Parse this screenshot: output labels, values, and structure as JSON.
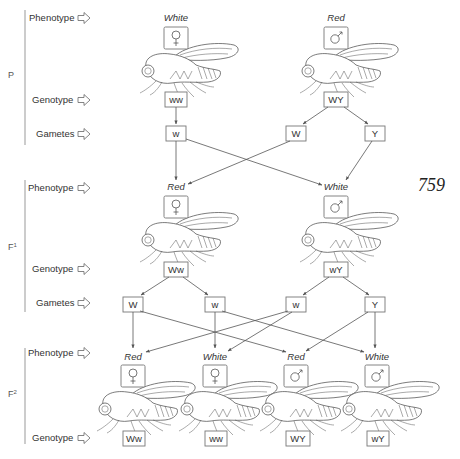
{
  "page_number": "759",
  "row_labels": {
    "phenotype": "Phenotype",
    "genotype": "Genotype",
    "gametes": "Gametes"
  },
  "generations": [
    {
      "label": "P",
      "phenotypes": [
        {
          "text": "White",
          "sex": "female",
          "sex_icon": "female-symbol-icon"
        },
        {
          "text": "Red",
          "sex": "male",
          "sex_icon": "male-symbol-icon"
        }
      ],
      "genotypes": [
        "ww",
        "WY"
      ],
      "gametes": [
        "w",
        "W",
        "Y"
      ]
    },
    {
      "label": "F1",
      "phenotypes": [
        {
          "text": "Red",
          "sex": "female",
          "sex_icon": "female-symbol-icon"
        },
        {
          "text": "White",
          "sex": "male",
          "sex_icon": "male-symbol-icon"
        }
      ],
      "genotypes": [
        "Ww",
        "wY"
      ],
      "gametes": [
        "W",
        "w",
        "w",
        "Y"
      ]
    },
    {
      "label": "F2",
      "phenotypes": [
        {
          "text": "Red",
          "sex": "female",
          "sex_icon": "female-symbol-icon"
        },
        {
          "text": "White",
          "sex": "female",
          "sex_icon": "female-symbol-icon"
        },
        {
          "text": "Red",
          "sex": "male",
          "sex_icon": "male-symbol-icon"
        },
        {
          "text": "White",
          "sex": "male",
          "sex_icon": "male-symbol-icon"
        }
      ],
      "genotypes": [
        "Ww",
        "ww",
        "WY",
        "wY"
      ]
    }
  ],
  "generation_labels": {
    "p": "P",
    "f1": "F",
    "f1_sup": "1",
    "f2": "F",
    "f2_sup": "2"
  },
  "colors": {
    "line": "#555555",
    "box_border": "#777777",
    "text": "#333333",
    "background": "#ffffff"
  }
}
